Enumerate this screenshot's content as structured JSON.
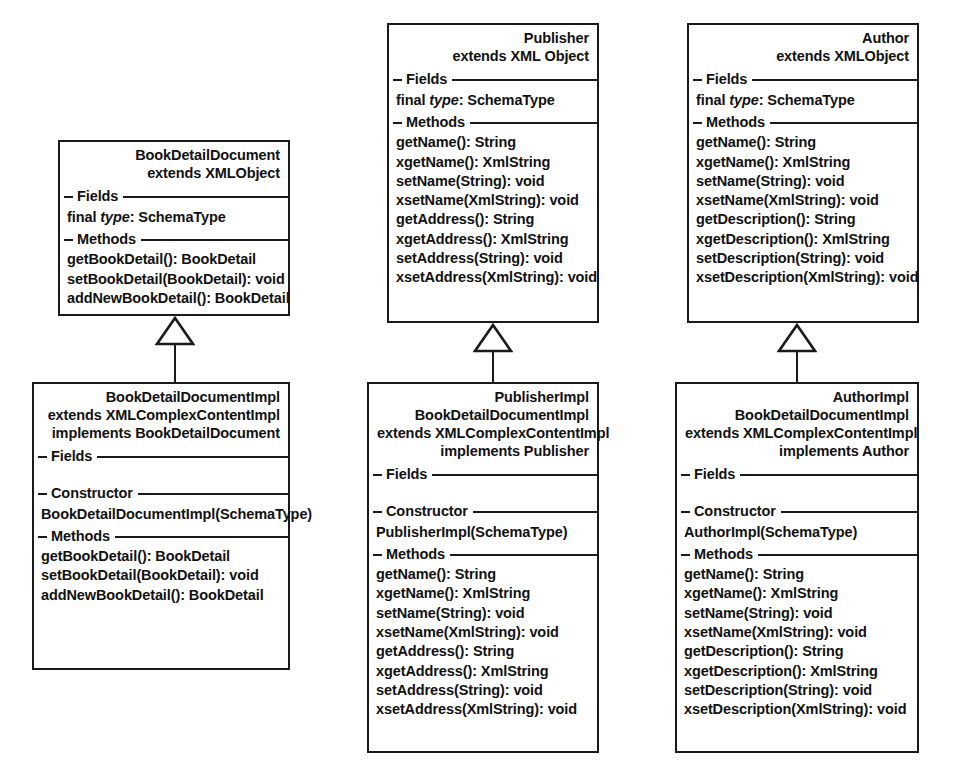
{
  "diagram": {
    "kind": "uml-class-diagram",
    "stroke_color": "#1a1a1a",
    "background_color": "#ffffff",
    "relationship_type": "generalization"
  },
  "classes": [
    {
      "id": "book-detail-document",
      "title_lines": [
        "BookDetailDocument",
        "extends XMLObject"
      ],
      "sections": [
        {
          "label": "Fields",
          "members": [
            {
              "parts": [
                {
                  "text": "final ",
                  "style": "normal"
                },
                {
                  "text": "type",
                  "style": "italic"
                },
                {
                  "text": ": SchemaType",
                  "style": "normal"
                }
              ]
            }
          ]
        },
        {
          "label": "Methods",
          "members": [
            {
              "parts": [
                {
                  "text": "getBookDetail(): BookDetail",
                  "style": "normal"
                }
              ]
            },
            {
              "parts": [
                {
                  "text": "setBookDetail(BookDetail): void",
                  "style": "normal"
                }
              ]
            },
            {
              "parts": [
                {
                  "text": "addNewBookDetail(): BookDetail",
                  "style": "normal"
                }
              ]
            }
          ]
        }
      ]
    },
    {
      "id": "book-detail-document-impl",
      "title_lines": [
        "BookDetailDocumentImpl",
        "extends XMLComplexContentImpl",
        "implements BookDetailDocument"
      ],
      "sections": [
        {
          "label": "Fields",
          "members": []
        },
        {
          "label": "Constructor",
          "members": [
            {
              "parts": [
                {
                  "text": "BookDetailDocumentImpl(SchemaType)",
                  "style": "normal"
                }
              ]
            }
          ]
        },
        {
          "label": "Methods",
          "members": [
            {
              "parts": [
                {
                  "text": "getBookDetail(): BookDetail",
                  "style": "normal"
                }
              ]
            },
            {
              "parts": [
                {
                  "text": "setBookDetail(BookDetail): void",
                  "style": "normal"
                }
              ]
            },
            {
              "parts": [
                {
                  "text": "addNewBookDetail(): BookDetail",
                  "style": "normal"
                }
              ]
            }
          ]
        }
      ]
    },
    {
      "id": "publisher",
      "title_lines": [
        "Publisher",
        "extends XML Object"
      ],
      "sections": [
        {
          "label": "Fields",
          "members": [
            {
              "parts": [
                {
                  "text": "final ",
                  "style": "normal"
                },
                {
                  "text": "type",
                  "style": "italic"
                },
                {
                  "text": ": SchemaType",
                  "style": "normal"
                }
              ]
            }
          ]
        },
        {
          "label": "Methods",
          "members": [
            {
              "parts": [
                {
                  "text": "getName(): String",
                  "style": "normal"
                }
              ]
            },
            {
              "parts": [
                {
                  "text": "xgetName(): XmlString",
                  "style": "normal"
                }
              ]
            },
            {
              "parts": [
                {
                  "text": "setName(String): void",
                  "style": "normal"
                }
              ]
            },
            {
              "parts": [
                {
                  "text": "xsetName(XmlString): void",
                  "style": "normal"
                }
              ]
            },
            {
              "parts": [
                {
                  "text": "getAddress(): String",
                  "style": "normal"
                }
              ]
            },
            {
              "parts": [
                {
                  "text": "xgetAddress(): XmlString",
                  "style": "normal"
                }
              ]
            },
            {
              "parts": [
                {
                  "text": "setAddress(String): void",
                  "style": "normal"
                }
              ]
            },
            {
              "parts": [
                {
                  "text": "xsetAddress(XmlString): void",
                  "style": "normal"
                }
              ]
            }
          ]
        }
      ]
    },
    {
      "id": "publisher-impl",
      "title_lines": [
        "PublisherImpl",
        "BookDetailDocumentImpl",
        "extends XMLComplexContentImpl",
        "implements Publisher"
      ],
      "sections": [
        {
          "label": "Fields",
          "members": []
        },
        {
          "label": "Constructor",
          "members": [
            {
              "parts": [
                {
                  "text": "PublisherImpl(SchemaType)",
                  "style": "normal"
                }
              ]
            }
          ]
        },
        {
          "label": "Methods",
          "members": [
            {
              "parts": [
                {
                  "text": "getName(): String",
                  "style": "normal"
                }
              ]
            },
            {
              "parts": [
                {
                  "text": "xgetName(): XmlString",
                  "style": "normal"
                }
              ]
            },
            {
              "parts": [
                {
                  "text": "setName(String): void",
                  "style": "normal"
                }
              ]
            },
            {
              "parts": [
                {
                  "text": "xsetName(XmlString): void",
                  "style": "normal"
                }
              ]
            },
            {
              "parts": [
                {
                  "text": "getAddress(): String",
                  "style": "normal"
                }
              ]
            },
            {
              "parts": [
                {
                  "text": "xgetAddress(): XmlString",
                  "style": "normal"
                }
              ]
            },
            {
              "parts": [
                {
                  "text": "setAddress(String): void",
                  "style": "normal"
                }
              ]
            },
            {
              "parts": [
                {
                  "text": "xsetAddress(XmlString): void",
                  "style": "normal"
                }
              ]
            }
          ]
        }
      ]
    },
    {
      "id": "author",
      "title_lines": [
        "Author",
        "extends XMLObject"
      ],
      "sections": [
        {
          "label": "Fields",
          "members": [
            {
              "parts": [
                {
                  "text": "final ",
                  "style": "normal"
                },
                {
                  "text": "type",
                  "style": "italic"
                },
                {
                  "text": ": SchemaType",
                  "style": "normal"
                }
              ]
            }
          ]
        },
        {
          "label": "Methods",
          "members": [
            {
              "parts": [
                {
                  "text": "getName(): String",
                  "style": "normal"
                }
              ]
            },
            {
              "parts": [
                {
                  "text": "xgetName(): XmlString",
                  "style": "normal"
                }
              ]
            },
            {
              "parts": [
                {
                  "text": "setName(String): void",
                  "style": "normal"
                }
              ]
            },
            {
              "parts": [
                {
                  "text": "xsetName(XmlString): void",
                  "style": "normal"
                }
              ]
            },
            {
              "parts": [
                {
                  "text": "getDescription(): String",
                  "style": "normal"
                }
              ]
            },
            {
              "parts": [
                {
                  "text": "xgetDescription(): XmlString",
                  "style": "normal"
                }
              ]
            },
            {
              "parts": [
                {
                  "text": "setDescription(String): void",
                  "style": "normal"
                }
              ]
            },
            {
              "parts": [
                {
                  "text": "xsetDescription(XmlString): void",
                  "style": "normal"
                }
              ]
            }
          ]
        }
      ]
    },
    {
      "id": "author-impl",
      "title_lines": [
        "AuthorImpl",
        "BookDetailDocumentImpl",
        "extends XMLComplexContentImpl",
        "implements Author"
      ],
      "sections": [
        {
          "label": "Fields",
          "members": []
        },
        {
          "label": "Constructor",
          "members": [
            {
              "parts": [
                {
                  "text": "AuthorImpl(SchemaType)",
                  "style": "normal"
                }
              ]
            }
          ]
        },
        {
          "label": "Methods",
          "members": [
            {
              "parts": [
                {
                  "text": "getName(): String",
                  "style": "normal"
                }
              ]
            },
            {
              "parts": [
                {
                  "text": "xgetName(): XmlString",
                  "style": "normal"
                }
              ]
            },
            {
              "parts": [
                {
                  "text": "setName(String): void",
                  "style": "normal"
                }
              ]
            },
            {
              "parts": [
                {
                  "text": "xsetName(XmlString): void",
                  "style": "normal"
                }
              ]
            },
            {
              "parts": [
                {
                  "text": "getDescription(): String",
                  "style": "normal"
                }
              ]
            },
            {
              "parts": [
                {
                  "text": "xgetDescription(): XmlString",
                  "style": "normal"
                }
              ]
            },
            {
              "parts": [
                {
                  "text": "setDescription(String): void",
                  "style": "normal"
                }
              ]
            },
            {
              "parts": [
                {
                  "text": "xsetDescription(XmlString): void",
                  "style": "normal"
                }
              ]
            }
          ]
        }
      ]
    }
  ],
  "relationships": [
    {
      "id": "gen-bookdetail",
      "from": "book-detail-document-impl",
      "to": "book-detail-document"
    },
    {
      "id": "gen-publisher",
      "from": "publisher-impl",
      "to": "publisher"
    },
    {
      "id": "gen-author",
      "from": "author-impl",
      "to": "author"
    }
  ],
  "layout": {
    "boxes": {
      "book-detail-document": {
        "x": 58,
        "y": 140,
        "w": 232,
        "h": 176
      },
      "book-detail-document-impl": {
        "x": 32,
        "y": 382,
        "w": 258,
        "h": 288
      },
      "publisher": {
        "x": 387,
        "y": 23,
        "w": 212,
        "h": 300
      },
      "publisher-impl": {
        "x": 367,
        "y": 382,
        "w": 232,
        "h": 371
      },
      "author": {
        "x": 687,
        "y": 23,
        "w": 232,
        "h": 300
      },
      "author-impl": {
        "x": 675,
        "y": 382,
        "w": 244,
        "h": 371
      }
    },
    "connectors": {
      "gen-bookdetail": {
        "x": 152,
        "y": 316,
        "w": 46,
        "h": 66
      },
      "gen-publisher": {
        "x": 470,
        "y": 323,
        "w": 46,
        "h": 59
      },
      "gen-author": {
        "x": 774,
        "y": 323,
        "w": 46,
        "h": 59
      }
    }
  }
}
